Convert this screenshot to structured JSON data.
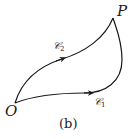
{
  "diagram": {
    "points": {
      "start": {
        "label": "O"
      },
      "end": {
        "label": "P"
      }
    },
    "curves": [
      {
        "name": "C1",
        "symbol": "𝒞",
        "subscript": "1",
        "direction": "O to P (lower path)"
      },
      {
        "name": "C2",
        "symbol": "𝒞",
        "subscript": "2",
        "direction": "O to P (upper path)"
      }
    ],
    "caption": "(b)",
    "colors": {
      "stroke": "#1a1a1a",
      "background": "#ffffff"
    }
  }
}
